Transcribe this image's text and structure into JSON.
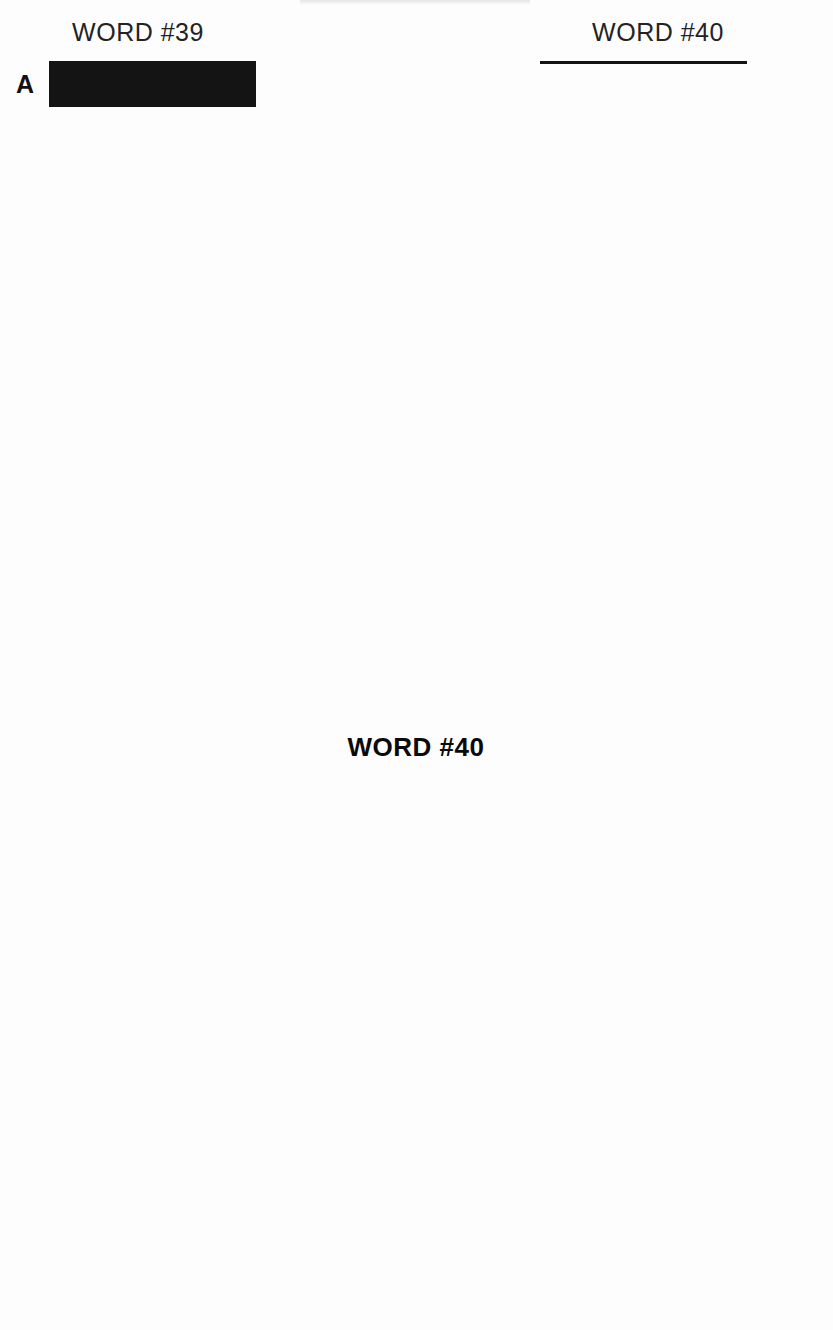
{
  "page": {
    "background_color": "#fdfdfd",
    "ink_color": "#141414",
    "filled_cell_color": "#4b4b4b"
  },
  "letter_panels": [
    {
      "id": "left",
      "title": "WORD #39",
      "side": "left",
      "columns": 5,
      "letters": [
        "A",
        "B",
        "C",
        "D",
        "E",
        "F",
        "G",
        "H",
        "I",
        "J",
        "K",
        "L",
        "M",
        "N",
        "O",
        "P",
        "Q",
        "R",
        "S",
        "T",
        "U",
        "V",
        "W",
        "X",
        "Y",
        "Z"
      ],
      "all_cells_filled": true
    },
    {
      "id": "right",
      "title": "WORD #40",
      "side": "right",
      "columns": 5,
      "letters": [
        "A",
        "B",
        "C",
        "D",
        "E",
        "F",
        "G",
        "H",
        "I",
        "J",
        "K",
        "L",
        "M",
        "N",
        "O",
        "P",
        "Q",
        "R",
        "S",
        "T",
        "U",
        "V",
        "W",
        "X",
        "Y",
        "Z"
      ],
      "all_cells_filled": true
    }
  ],
  "word_columns": [
    {
      "id": "top",
      "title": "",
      "rows": 7,
      "cells_per_row": 5,
      "values": [
        [
          "",
          "",
          "",
          "",
          ""
        ],
        [
          "",
          "",
          "",
          "",
          ""
        ],
        [
          "",
          "",
          "",
          "",
          ""
        ],
        [
          "",
          "",
          "",
          "",
          ""
        ],
        [
          "",
          "",
          "",
          "",
          ""
        ],
        [
          "",
          "",
          "",
          "",
          ""
        ],
        [
          "",
          "",
          "",
          "",
          ""
        ]
      ]
    },
    {
      "id": "bottom",
      "title": "WORD #40",
      "rows": 7,
      "cells_per_row": 5,
      "values": [
        [
          "",
          "",
          "",
          "",
          ""
        ],
        [
          "",
          "",
          "",
          "",
          ""
        ],
        [
          "",
          "",
          "",
          "",
          ""
        ],
        [
          "",
          "",
          "",
          "",
          ""
        ],
        [
          "",
          "",
          "",
          "",
          ""
        ],
        [
          "",
          "",
          "",
          "",
          ""
        ],
        [
          "",
          "",
          "",
          "",
          ""
        ]
      ]
    }
  ]
}
